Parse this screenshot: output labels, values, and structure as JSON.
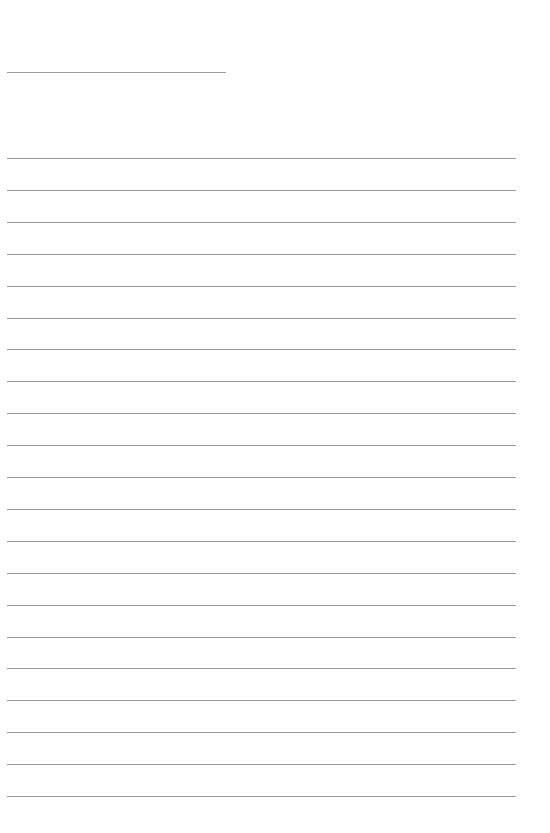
{
  "page": {
    "type": "blank lined writing sheet",
    "background": "#ffffff",
    "line_color": "#9c9c9c",
    "title_line": {
      "y": 72,
      "x_start": 7,
      "x_end": 226
    },
    "ruled_lines": {
      "count": 21,
      "first_y": 158,
      "spacing": 31.9,
      "x_start": 7,
      "x_end": 516
    }
  }
}
